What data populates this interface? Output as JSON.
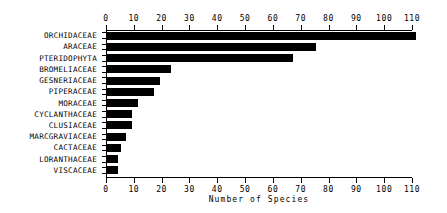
{
  "chart_data": {
    "type": "bar",
    "orientation": "horizontal",
    "title": "",
    "xlabel": "Number of Species",
    "ylabel": "",
    "xlim": [
      0,
      110
    ],
    "xticks": [
      0,
      10,
      20,
      30,
      40,
      50,
      60,
      70,
      80,
      90,
      100,
      110
    ],
    "xtick_labels": [
      "0",
      "10",
      "20",
      "30",
      "40",
      "50",
      "60",
      "70",
      "80",
      "90",
      "100",
      "110"
    ],
    "grid": false,
    "legend": null,
    "bar_color": "#000000",
    "axes_color": "#000000",
    "background": "#ffffff",
    "top_axis": true,
    "bottom_axis": true,
    "categories": [
      "ORCHIDACEAE",
      "ARACEAE",
      "PTERIDOPHYTA",
      "BROMELIACEAE",
      "GESNERIACEAE",
      "PIPERACEAE",
      "MORACEAE",
      "CYCLANTHACEAE",
      "CLUSIACEAE",
      "MARCGRAVIACEAE",
      "CACTACEAE",
      "LORANTHACEAE",
      "VISCACEAE"
    ],
    "values": [
      111,
      75,
      67,
      23,
      19,
      17,
      11,
      9,
      9,
      7,
      5,
      4,
      4
    ]
  }
}
